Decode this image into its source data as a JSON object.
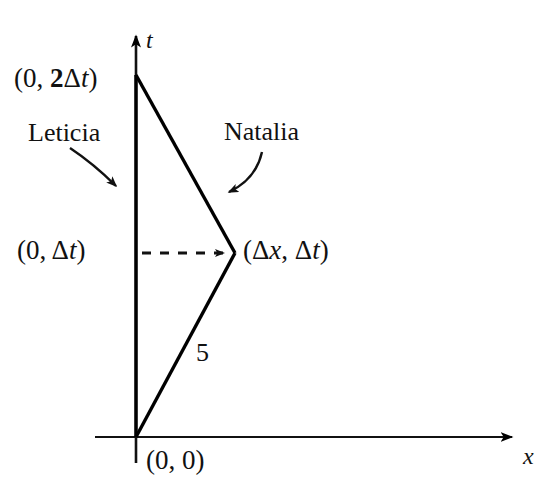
{
  "figure": {
    "type": "spacetime-diagram",
    "background_color": "#ffffff",
    "ink_color": "#000000",
    "axes": {
      "x_axis_label": "x",
      "t_axis_label": "t",
      "origin_label": "(0, 0)"
    },
    "points": {
      "origin": "(0, 0)",
      "meeting": "(0, Δt)",
      "return": "(0, 2Δt)",
      "turnaround": "(Δx, Δt)"
    },
    "worldlines": [
      {
        "name": "Leticia",
        "label": "Leticia",
        "description": "vertical worldline along the t axis"
      },
      {
        "name": "Natalia",
        "label": "Natalia",
        "description": "outbound and inbound slanted worldline forming a triangle"
      }
    ],
    "segment_labels": [
      {
        "name": "outbound-segment-length",
        "value": "5"
      }
    ],
    "dashed_connector": {
      "name": "simultaneity-dashes",
      "from": "(0, Δt)",
      "to": "(Δx, Δt)",
      "style": "dashed-with-arrowhead"
    }
  },
  "chart_data": {
    "type": "line",
    "title": "",
    "xlabel": "x",
    "ylabel": "t",
    "grid": false,
    "legend": "none",
    "xlim": [
      0,
      3
    ],
    "ylim": [
      0,
      2
    ],
    "annotations": [
      {
        "text": "(0, 2Δt)",
        "x": 0,
        "y": 2
      },
      {
        "text": "(0, Δt)",
        "x": 0,
        "y": 1
      },
      {
        "text": "(Δx, Δt)",
        "x": 1,
        "y": 1
      },
      {
        "text": "(0, 0)",
        "x": 0,
        "y": 0
      },
      {
        "text": "Leticia",
        "x": 0,
        "y": 1.5
      },
      {
        "text": "Natalia",
        "x": 1.2,
        "y": 1.55
      },
      {
        "text": "5",
        "x": 0.6,
        "y": 0.45
      }
    ],
    "series": [
      {
        "name": "Leticia",
        "x": [
          0,
          0
        ],
        "y": [
          0,
          2
        ]
      },
      {
        "name": "Natalia",
        "x": [
          0,
          1,
          0
        ],
        "y": [
          0,
          1,
          2
        ]
      },
      {
        "name": "simultaneity-dashes",
        "x": [
          0,
          1
        ],
        "y": [
          1,
          1
        ],
        "style": "dashed"
      }
    ]
  }
}
